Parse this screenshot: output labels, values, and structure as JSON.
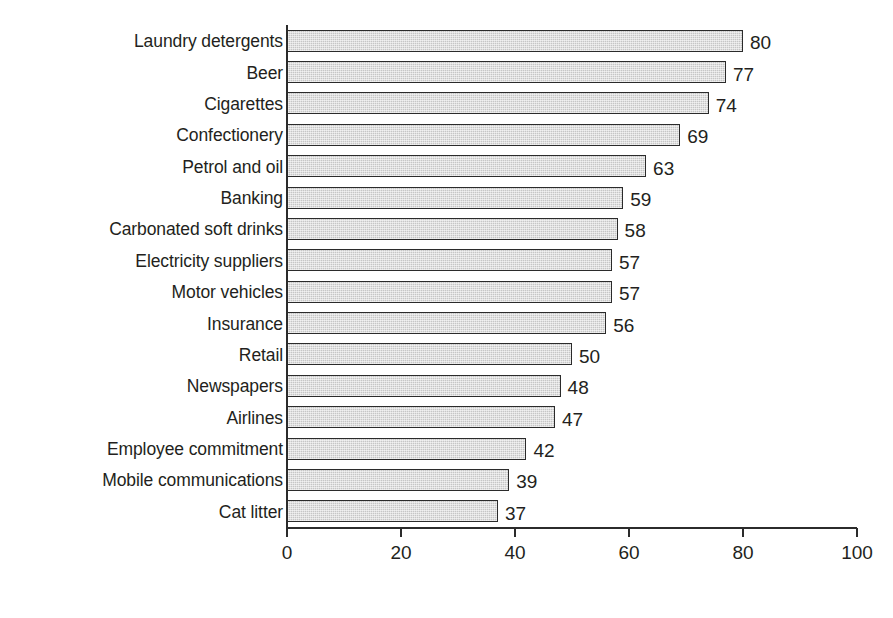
{
  "chart_data": {
    "type": "bar",
    "orientation": "horizontal",
    "title": "",
    "subtitle": "",
    "xlabel": "",
    "ylabel": "",
    "xlim": [
      0,
      100
    ],
    "xticks": [
      0,
      20,
      40,
      60,
      80,
      100
    ],
    "xtick_labels": [
      "0",
      "20",
      "40",
      "60",
      "80",
      "100"
    ],
    "grid": false,
    "legend": false,
    "legend_position": "none",
    "categories": [
      "Laundry detergents",
      "Beer",
      "Cigarettes",
      "Confectionery",
      "Petrol and oil",
      "Banking",
      "Carbonated soft drinks",
      "Electricity suppliers",
      "Motor vehicles",
      "Insurance",
      "Retail",
      "Newspapers",
      "Airlines",
      "Employee commitment",
      "Mobile communications",
      "Cat litter"
    ],
    "values": [
      80,
      77,
      74,
      69,
      63,
      59,
      58,
      57,
      57,
      56,
      50,
      48,
      47,
      42,
      39,
      37
    ],
    "value_labels": [
      "80",
      "77",
      "74",
      "69",
      "63",
      "59",
      "58",
      "57",
      "57",
      "56",
      "50",
      "48",
      "47",
      "42",
      "39",
      "37"
    ],
    "colors": {
      "bar_fill": "#c6c6c6",
      "bar_border": "#2b2b2b",
      "axis": "#2b2b2b",
      "text": "#231f20",
      "background": "#ffffff"
    }
  }
}
